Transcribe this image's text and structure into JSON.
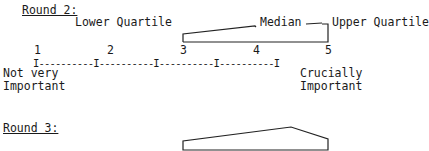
{
  "round2": {
    "heading": "Round 2:",
    "labels": {
      "lower_quartile": "Lower Quartile",
      "median": "Median",
      "upper_quartile": "Upper Quartile"
    },
    "scale": {
      "ticks": [
        "1",
        "2",
        "3",
        "4",
        "5"
      ],
      "line": "I----------I----------I----------I----------I",
      "left_anchor": [
        "Not very",
        "Important"
      ],
      "right_anchor": [
        "Crucially",
        "Important"
      ]
    }
  },
  "round3": {
    "heading": "Round 3:"
  }
}
